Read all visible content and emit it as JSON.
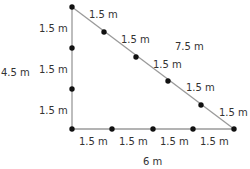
{
  "diagram": {
    "type": "right-triangle",
    "colors": {
      "vertical_edge": "#9a9a9a",
      "horizontal_edge": "#9a9a9a",
      "hypotenuse": "#9a9a9a",
      "dots": "#111111",
      "text": "#333333"
    },
    "vertices": {
      "top": [
        72,
        7
      ],
      "bottom_left": [
        72,
        129
      ],
      "bottom_right": [
        234,
        129
      ]
    },
    "sides": {
      "vertical": {
        "total_label": "4.5 m",
        "segments": [
          "1.5 m",
          "1.5 m",
          "1.5 m"
        ]
      },
      "horizontal": {
        "total_label": "6 m",
        "segments": [
          "1.5 m",
          "1.5 m",
          "1.5 m",
          "1.5 m"
        ]
      },
      "hypotenuse": {
        "total_label": "7.5 m",
        "segments": [
          "1.5 m",
          "1.5 m",
          "1.5 m",
          "1.5 m",
          "1.5 m"
        ]
      }
    }
  }
}
